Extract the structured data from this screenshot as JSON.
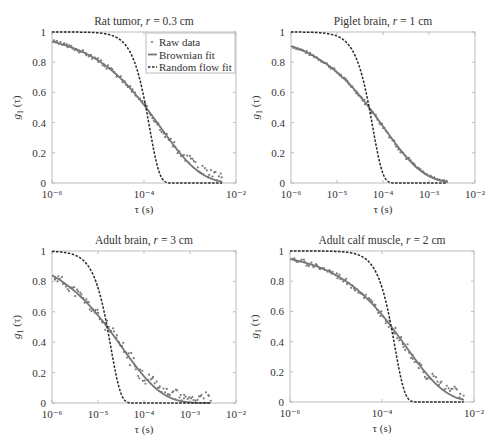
{
  "chart_data": [
    {
      "type": "scatter+line",
      "title": "Rat tumor, r = 0.3 cm",
      "title_parts": [
        "Rat tumor, ",
        "r",
        " = 0.3 cm"
      ],
      "xlabel": "τ (s)",
      "ylabel": "g1 (τ)",
      "xscale": "log",
      "xlim": [
        1e-06,
        0.01
      ],
      "ylim": [
        0,
        1
      ],
      "xticks": [
        -6,
        -4,
        -2
      ],
      "yticks": [
        0,
        0.2,
        0.4,
        0.6,
        0.8,
        1
      ],
      "frame": [
        52,
        32,
        236,
        183
      ],
      "brownian_tau": 0.00023,
      "random_tau": 0.000132,
      "fit_xmax": 0.005,
      "noise_seed": 3,
      "noise_amp": 0.03,
      "tail_noise": 0.06,
      "legend": {
        "show": true,
        "entries": [
          "Raw data",
          "Brownian fit",
          "Random flow fit"
        ]
      },
      "series": [
        {
          "name": "Raw data",
          "style": "dots"
        },
        {
          "name": "Brownian fit",
          "style": "solid"
        },
        {
          "name": "Random flow fit",
          "style": "dashed"
        }
      ]
    },
    {
      "type": "scatter+line",
      "title": "Piglet brain, r = 1 cm",
      "title_parts": [
        "Piglet brain, ",
        "r",
        " = 1 cm"
      ],
      "xlabel": "τ (s)",
      "ylabel": "g1 (τ)",
      "xscale": "log",
      "xlim": [
        1e-06,
        0.01
      ],
      "ylim": [
        0,
        1
      ],
      "xticks": [
        -6,
        -5,
        -4,
        -3,
        -2
      ],
      "yticks": [
        0,
        0.2,
        0.4,
        0.6,
        0.8,
        1
      ],
      "frame": [
        291,
        32,
        475,
        183
      ],
      "brownian_tau": 0.000104,
      "random_tau": 6e-05,
      "fit_xmax": 0.0025,
      "noise_seed": 7,
      "noise_amp": 0.02,
      "tail_noise": 0.01,
      "legend": {
        "show": false
      },
      "series": [
        {
          "name": "Raw data",
          "style": "dots"
        },
        {
          "name": "Brownian fit",
          "style": "solid"
        },
        {
          "name": "Random flow fit",
          "style": "dashed"
        }
      ]
    },
    {
      "type": "scatter+line",
      "title": "Adult brain, r = 3 cm",
      "title_parts": [
        "Adult brain, ",
        "r",
        " = 3 cm"
      ],
      "xlabel": "τ (s)",
      "ylabel": "g1 (τ)",
      "xscale": "log",
      "xlim": [
        1e-06,
        0.01
      ],
      "ylim": [
        0,
        1
      ],
      "xticks": [
        -6,
        -5,
        -4,
        -3,
        -2
      ],
      "yticks": [
        0,
        0.2,
        0.4,
        0.6,
        0.8,
        1
      ],
      "frame": [
        52,
        251,
        236,
        403
      ],
      "brownian_tau": 3.3e-05,
      "random_tau": 1.9e-05,
      "fit_xmax": 0.0028,
      "noise_seed": 11,
      "noise_amp": 0.06,
      "tail_noise": 0.07,
      "legend": {
        "show": false
      },
      "series": [
        {
          "name": "Raw data",
          "style": "dots"
        },
        {
          "name": "Brownian fit",
          "style": "solid"
        },
        {
          "name": "Random flow fit",
          "style": "dashed"
        }
      ]
    },
    {
      "type": "scatter+line",
      "title": "Adult calf muscle, r = 2 cm",
      "title_parts": [
        "Adult calf muscle, ",
        "r",
        " = 2 cm"
      ],
      "xlabel": "τ (s)",
      "ylabel": "g1 (τ)",
      "xscale": "log",
      "xlim": [
        1e-06,
        0.01
      ],
      "ylim": [
        0,
        1
      ],
      "xticks": [
        -6,
        -4,
        -2
      ],
      "yticks": [
        0,
        0.2,
        0.4,
        0.6,
        0.8,
        1
      ],
      "frame": [
        290,
        251,
        474,
        402
      ],
      "brownian_tau": 0.00033,
      "random_tau": 0.00019,
      "fit_xmax": 0.006,
      "noise_seed": 19,
      "noise_amp": 0.04,
      "tail_noise": 0.08,
      "legend": {
        "show": false
      },
      "series": [
        {
          "name": "Raw data",
          "style": "dots"
        },
        {
          "name": "Brownian fit",
          "style": "solid"
        },
        {
          "name": "Random flow fit",
          "style": "dashed"
        }
      ]
    }
  ],
  "colors": {
    "axes": "#bdbdbd",
    "text": "#333333",
    "brownian": "#777777",
    "random": "#2a2a2a",
    "dots": "#7a7a7a"
  }
}
